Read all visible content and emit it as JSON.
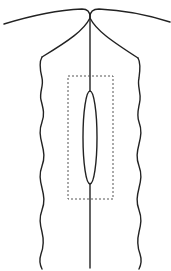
{
  "diagram": {
    "type": "line-drawing",
    "colors": {
      "background": "#ffffff",
      "stroke": "#222222",
      "dashed_stroke": "#555555"
    },
    "elements": {
      "top_arc_left": {
        "from": [
          4,
          24
        ],
        "to": [
          90,
          12
        ]
      },
      "top_arc_right": {
        "from": [
          90,
          12
        ],
        "to": [
          170,
          22
        ]
      },
      "neck_point": [
        90,
        16
      ],
      "left_shoulder": [
        42,
        57
      ],
      "right_shoulder": [
        138,
        58
      ],
      "center_line": {
        "x": 90,
        "y1": 16,
        "y2": 268
      },
      "oval": {
        "cx": 90,
        "cy": 137,
        "rx": 7,
        "ry": 46
      },
      "dashed_rect": {
        "x": 68,
        "y": 76,
        "width": 45,
        "height": 123
      }
    }
  }
}
